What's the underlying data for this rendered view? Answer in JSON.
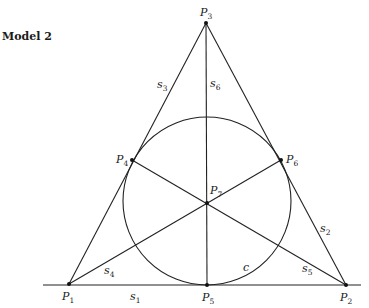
{
  "title": "Model 2",
  "points": [
    {
      "id": "P1",
      "label": "P",
      "sub": "1",
      "x": 69,
      "y": 284,
      "lx": 62,
      "ly": 300
    },
    {
      "id": "P2",
      "label": "P",
      "sub": "2",
      "x": 346,
      "y": 285,
      "lx": 340,
      "ly": 301
    },
    {
      "id": "P3",
      "label": "P",
      "sub": "3",
      "x": 206,
      "y": 23,
      "lx": 200,
      "ly": 16
    },
    {
      "id": "P4",
      "label": "P",
      "sub": "4",
      "x": 132,
      "y": 160,
      "lx": 116,
      "ly": 163
    },
    {
      "id": "P5",
      "label": "P",
      "sub": "5",
      "x": 207,
      "y": 285,
      "lx": 202,
      "ly": 301
    },
    {
      "id": "P6",
      "label": "P",
      "sub": "6",
      "x": 281,
      "y": 160,
      "lx": 286,
      "ly": 163
    },
    {
      "id": "P7",
      "label": "P",
      "sub": "7",
      "x": 207,
      "y": 203,
      "lx": 210,
      "ly": 194
    }
  ],
  "lines": [
    {
      "id": "s1",
      "label": "s",
      "sub": "1",
      "lx": 130,
      "ly": 300
    },
    {
      "id": "s2",
      "label": "s",
      "sub": "2",
      "lx": 320,
      "ly": 232
    },
    {
      "id": "s3",
      "label": "s",
      "sub": "3",
      "lx": 157,
      "ly": 88
    },
    {
      "id": "s4",
      "label": "s",
      "sub": "4",
      "lx": 104,
      "ly": 274
    },
    {
      "id": "s5",
      "label": "s",
      "sub": "5",
      "lx": 302,
      "ly": 272
    },
    {
      "id": "s6",
      "label": "s",
      "sub": "6",
      "lx": 210,
      "ly": 87
    }
  ],
  "circle": {
    "label": "c",
    "cx": 207,
    "cy": 201,
    "r": 84,
    "lx": 243,
    "ly": 271
  },
  "baseline": {
    "x1": 43,
    "x2": 361,
    "y": 285
  }
}
